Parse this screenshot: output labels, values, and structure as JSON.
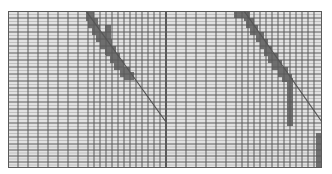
{
  "colors": {
    "background": "#ffffff",
    "panel_fill": "#e2e2e2",
    "grid_line": "#5a5a5a",
    "grid_line_light": "#a8a8a8",
    "shade": "#6e6e6e",
    "diagonal": "#555555"
  },
  "panels": [
    {
      "id": "left",
      "x": 8,
      "y": 11,
      "w": 158,
      "h": 157,
      "cols_x": [
        8,
        18,
        28,
        38,
        48,
        58,
        68,
        78,
        88,
        94,
        100,
        106,
        112,
        118,
        124,
        130,
        136,
        142,
        148,
        154,
        160,
        166
      ],
      "rows_y": [
        11,
        18,
        25,
        32,
        39,
        46,
        53,
        60,
        67,
        74,
        81,
        88,
        95,
        102,
        109,
        116,
        123,
        130,
        137,
        144,
        150,
        156,
        162,
        168
      ],
      "diagonal": {
        "x1": 86,
        "y1": 11,
        "x2": 166,
        "y2": 122
      },
      "shaded_cells": [
        {
          "x": 86,
          "y": 11,
          "w": 8,
          "h": 10
        },
        {
          "x": 88,
          "y": 18,
          "w": 10,
          "h": 10
        },
        {
          "x": 92,
          "y": 25,
          "w": 8,
          "h": 10
        },
        {
          "x": 96,
          "y": 32,
          "w": 10,
          "h": 10
        },
        {
          "x": 105,
          "y": 25,
          "w": 6,
          "h": 30
        },
        {
          "x": 100,
          "y": 39,
          "w": 12,
          "h": 10
        },
        {
          "x": 106,
          "y": 46,
          "w": 10,
          "h": 10
        },
        {
          "x": 110,
          "y": 53,
          "w": 10,
          "h": 10
        },
        {
          "x": 114,
          "y": 60,
          "w": 10,
          "h": 10
        },
        {
          "x": 120,
          "y": 67,
          "w": 10,
          "h": 10
        },
        {
          "x": 124,
          "y": 72,
          "w": 10,
          "h": 8
        }
      ]
    },
    {
      "id": "right",
      "x": 166,
      "y": 11,
      "w": 156,
      "h": 157,
      "cols_x": [
        166,
        176,
        186,
        196,
        206,
        216,
        226,
        236,
        242,
        248,
        254,
        260,
        266,
        272,
        278,
        284,
        290,
        296,
        302,
        308,
        314,
        322
      ],
      "rows_y": [
        11,
        18,
        25,
        32,
        39,
        46,
        53,
        60,
        67,
        74,
        81,
        88,
        95,
        102,
        109,
        116,
        123,
        130,
        137,
        144,
        150,
        156,
        162,
        168
      ],
      "diagonal": {
        "x1": 244,
        "y1": 11,
        "x2": 322,
        "y2": 122
      },
      "shaded_cells": [
        {
          "x": 234,
          "y": 11,
          "w": 10,
          "h": 7
        },
        {
          "x": 244,
          "y": 11,
          "w": 6,
          "h": 10
        },
        {
          "x": 246,
          "y": 18,
          "w": 8,
          "h": 10
        },
        {
          "x": 250,
          "y": 25,
          "w": 8,
          "h": 10
        },
        {
          "x": 256,
          "y": 32,
          "w": 8,
          "h": 10
        },
        {
          "x": 260,
          "y": 39,
          "w": 8,
          "h": 10
        },
        {
          "x": 264,
          "y": 46,
          "w": 8,
          "h": 10
        },
        {
          "x": 268,
          "y": 53,
          "w": 10,
          "h": 10
        },
        {
          "x": 272,
          "y": 60,
          "w": 10,
          "h": 10
        },
        {
          "x": 278,
          "y": 67,
          "w": 10,
          "h": 10
        },
        {
          "x": 282,
          "y": 74,
          "w": 10,
          "h": 8
        },
        {
          "x": 287,
          "y": 78,
          "w": 6,
          "h": 48
        },
        {
          "x": 316,
          "y": 133,
          "w": 6,
          "h": 35
        }
      ]
    }
  ]
}
